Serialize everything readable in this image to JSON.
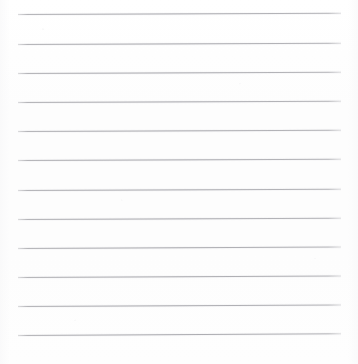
{
  "document": {
    "kind": "scanned-lined-paper",
    "title": "Blank ruled writing paper",
    "page_text": "",
    "handwriting_present": "no",
    "background_color": "#fefefe",
    "rule_color": "#acacb1",
    "page_width": 358,
    "page_height": 364
  },
  "ruling": {
    "line_count": 12,
    "line_spacing_px": 29.2,
    "first_line_y": 14,
    "last_line_y": 335,
    "left_margin_x": 18,
    "right_margin_x": 341,
    "line_length_px": 323,
    "line_thickness_px": 1,
    "skew_degrees": -0.22,
    "margin_rule_present": "no",
    "lines": [
      {
        "index": 1,
        "y": 14,
        "x_start": 18,
        "x_end": 341,
        "skew": -0.2
      },
      {
        "index": 2,
        "y": 44,
        "x_start": 18,
        "x_end": 341,
        "skew": -0.2
      },
      {
        "index": 3,
        "y": 73,
        "x_start": 18,
        "x_end": 341,
        "skew": -0.22
      },
      {
        "index": 4,
        "y": 102,
        "x_start": 18,
        "x_end": 341,
        "skew": -0.22
      },
      {
        "index": 5,
        "y": 131,
        "x_start": 18,
        "x_end": 341,
        "skew": -0.22
      },
      {
        "index": 6,
        "y": 160,
        "x_start": 18,
        "x_end": 341,
        "skew": -0.24
      },
      {
        "index": 7,
        "y": 190,
        "x_start": 18,
        "x_end": 341,
        "skew": -0.24
      },
      {
        "index": 8,
        "y": 219,
        "x_start": 18,
        "x_end": 341,
        "skew": -0.24
      },
      {
        "index": 9,
        "y": 248,
        "x_start": 18,
        "x_end": 341,
        "skew": -0.26
      },
      {
        "index": 10,
        "y": 277,
        "x_start": 18,
        "x_end": 341,
        "skew": -0.26
      },
      {
        "index": 11,
        "y": 306,
        "x_start": 18,
        "x_end": 341,
        "skew": -0.28
      },
      {
        "index": 12,
        "y": 335,
        "x_start": 18,
        "x_end": 341,
        "skew": -0.3
      }
    ]
  }
}
